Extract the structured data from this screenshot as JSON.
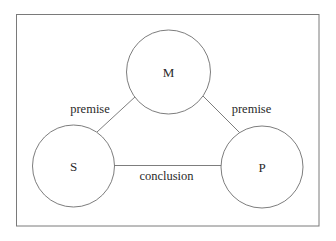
{
  "diagram": {
    "nodes": [
      {
        "id": "M",
        "label": "M",
        "cx": 168.5,
        "cy": 72,
        "r": 42
      },
      {
        "id": "S",
        "label": "S",
        "cx": 73.5,
        "cy": 166,
        "r": 41
      },
      {
        "id": "P",
        "label": "P",
        "cx": 262,
        "cy": 167,
        "r": 41
      }
    ],
    "edges": [
      {
        "from": "S",
        "to": "M",
        "label": "premise"
      },
      {
        "from": "M",
        "to": "P",
        "label": "premise"
      },
      {
        "from": "S",
        "to": "P",
        "label": "conclusion"
      }
    ],
    "colors": {
      "stroke": "#6e6e6e",
      "frame": "#7a7a7a",
      "text": "#2a2a2a",
      "background": "#ffffff"
    }
  }
}
